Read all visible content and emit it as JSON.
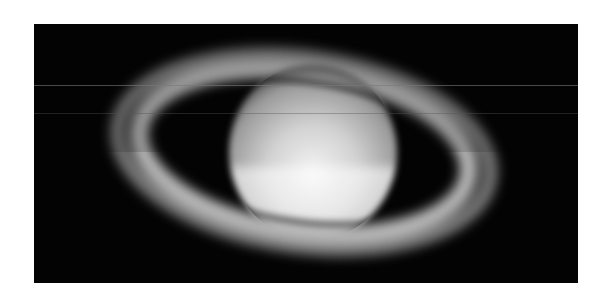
{
  "image": {
    "subject": "Saturn with rings",
    "description": "Grayscale telescope photograph of the planet Saturn with its ring system on a black background",
    "colors": {
      "background": "#ffffff",
      "sky": "#030303",
      "planet_light": "#eeeeee",
      "planet_mid": "#a8a8a8",
      "ring": "#bdbdbd"
    }
  }
}
